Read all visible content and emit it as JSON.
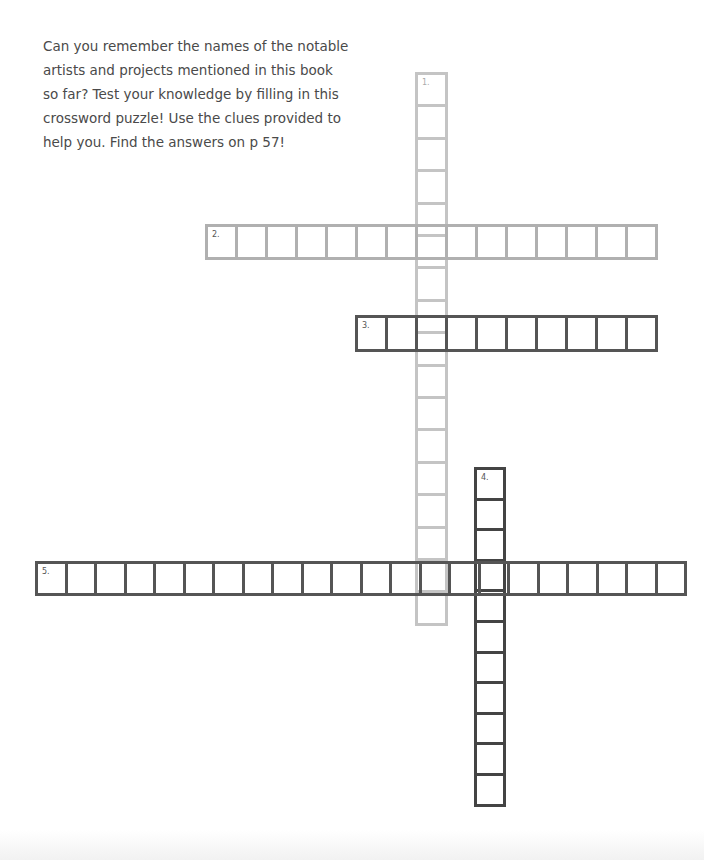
{
  "intro": {
    "lines": [
      "Can you remember the names of the notable",
      "artists and projects mentioned in this book",
      "so far? Test your knowledge by filling in this",
      "crossword puzzle! Use the clues provided to",
      "help you. Find the answers on p 57!"
    ]
  },
  "crossword": {
    "words": [
      {
        "number": "1.",
        "direction": "down",
        "cells": 17,
        "color": "#c4c4c4"
      },
      {
        "number": "2.",
        "direction": "across",
        "cells": 15,
        "color": "#b0b0b0"
      },
      {
        "number": "3.",
        "direction": "across",
        "cells": 10,
        "color": "#555555"
      },
      {
        "number": "4.",
        "direction": "down",
        "cells": 11,
        "color": "#444444"
      },
      {
        "number": "5.",
        "direction": "across",
        "cells": 22,
        "color": "#555555"
      }
    ]
  }
}
